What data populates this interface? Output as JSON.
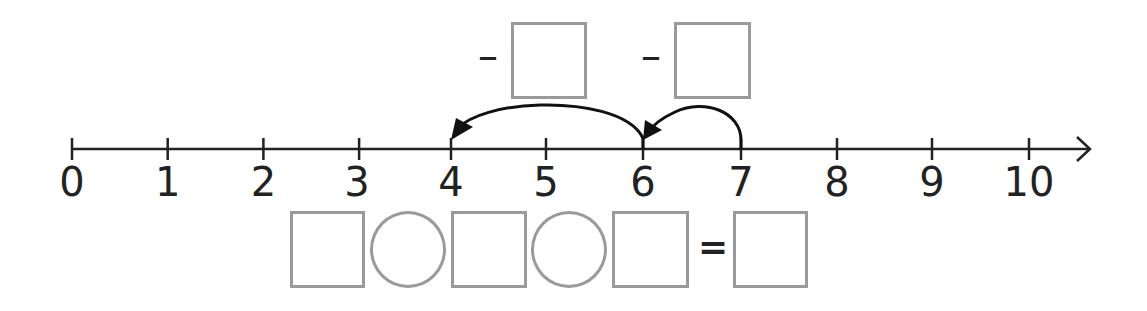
{
  "number_line": {
    "min": 0,
    "max": 10,
    "labels": [
      "0",
      "1",
      "2",
      "3",
      "4",
      "5",
      "6",
      "7",
      "8",
      "9",
      "10"
    ],
    "has_arrow_right": true,
    "line_color": "#222222"
  },
  "jumps": [
    {
      "from": 7,
      "to": 6,
      "direction": "left",
      "arrow_color": "#111111"
    },
    {
      "from": 6,
      "to": 4,
      "direction": "left",
      "arrow_color": "#111111"
    }
  ],
  "jump_boxes": [
    {
      "operator": "–",
      "value": ""
    },
    {
      "operator": "–",
      "value": ""
    }
  ],
  "equation": {
    "items": [
      {
        "type": "box",
        "value": ""
      },
      {
        "type": "circle",
        "value": ""
      },
      {
        "type": "box",
        "value": ""
      },
      {
        "type": "circle",
        "value": ""
      },
      {
        "type": "box",
        "value": ""
      },
      {
        "type": "equals",
        "value": "="
      },
      {
        "type": "box",
        "value": ""
      }
    ]
  },
  "colors": {
    "box_border": "#9a9a9a",
    "text": "#222222"
  }
}
